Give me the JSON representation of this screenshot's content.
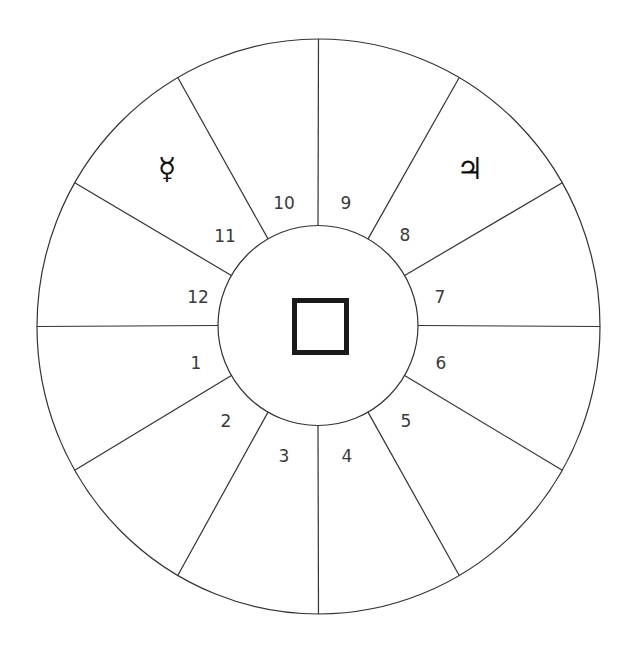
{
  "diagram": {
    "type": "astrological-house-wheel",
    "canvas": {
      "width": 634,
      "height": 650
    },
    "colors": {
      "line": "#333333",
      "text": "#3a3a3a",
      "square": "#1a1a1a",
      "background": "#ffffff"
    },
    "outer_circle": {
      "cx": 318.5,
      "cy": 326.5,
      "rx": 281.5,
      "ry": 287.5
    },
    "inner_circle": {
      "cx": 318,
      "cy": 325.5,
      "r": 100
    },
    "center_square": {
      "x": 294.5,
      "y": 300.5,
      "size": 52,
      "stroke_width": 5
    },
    "dividers_deg": [
      0,
      30,
      60,
      90,
      120,
      150,
      180,
      210,
      240,
      270,
      300,
      330
    ],
    "houses": [
      {
        "number": "1",
        "x": 196,
        "y": 363
      },
      {
        "number": "2",
        "x": 226,
        "y": 421
      },
      {
        "number": "3",
        "x": 284,
        "y": 456
      },
      {
        "number": "4",
        "x": 347,
        "y": 456
      },
      {
        "number": "5",
        "x": 406,
        "y": 421
      },
      {
        "number": "6",
        "x": 441,
        "y": 363
      },
      {
        "number": "7",
        "x": 440,
        "y": 297
      },
      {
        "number": "8",
        "x": 405,
        "y": 235
      },
      {
        "number": "9",
        "x": 346,
        "y": 203
      },
      {
        "number": "10",
        "x": 284,
        "y": 203
      },
      {
        "number": "11",
        "x": 225,
        "y": 236
      },
      {
        "number": "12",
        "x": 198,
        "y": 297
      }
    ],
    "planets": [
      {
        "name": "Mercury",
        "glyph": "☿",
        "house": "11",
        "x": 167,
        "y": 168
      },
      {
        "name": "Jupiter",
        "glyph": "♃",
        "house": "8",
        "x": 470,
        "y": 168
      }
    ]
  }
}
